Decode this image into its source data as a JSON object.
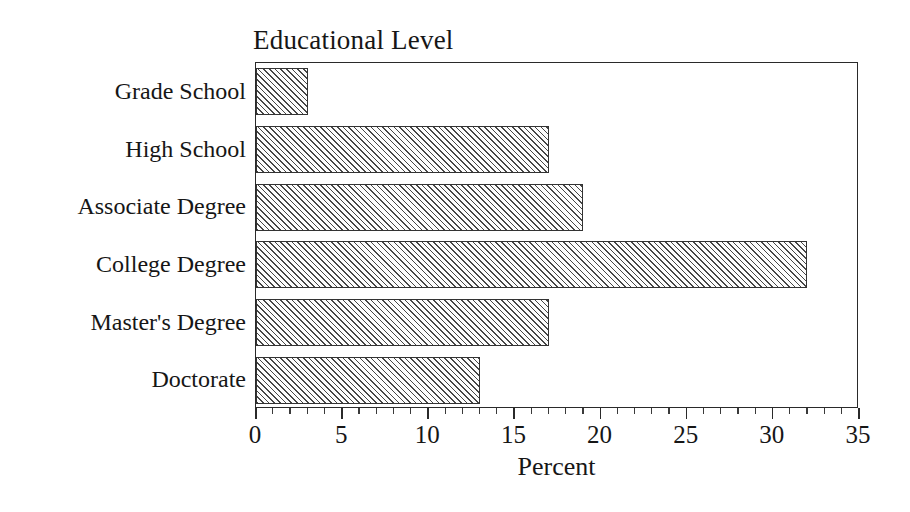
{
  "chart_data": {
    "type": "bar",
    "orientation": "horizontal",
    "title": "Educational Level",
    "xlabel": "Percent",
    "ylabel": "",
    "categories": [
      "Grade School",
      "High School",
      "Associate Degree",
      "College Degree",
      "Master's Degree",
      "Doctorate"
    ],
    "values": [
      3,
      17,
      19,
      32,
      17,
      13
    ],
    "xlim": [
      0,
      35
    ],
    "ylim": null,
    "xticks": [
      0,
      5,
      10,
      15,
      20,
      25,
      30,
      35
    ],
    "xtick_labels": [
      "0",
      "5",
      "10",
      "15",
      "20",
      "25",
      "30",
      "35"
    ],
    "minor_tick_step": 1,
    "grid": false,
    "legend": null,
    "bar_fill": "#cfcfcf",
    "bar_hatch": "diagonal",
    "bar_edge_color": "#333333",
    "axis_color": "#2a2a2a",
    "text_color": "#161616",
    "background": "#ffffff"
  }
}
